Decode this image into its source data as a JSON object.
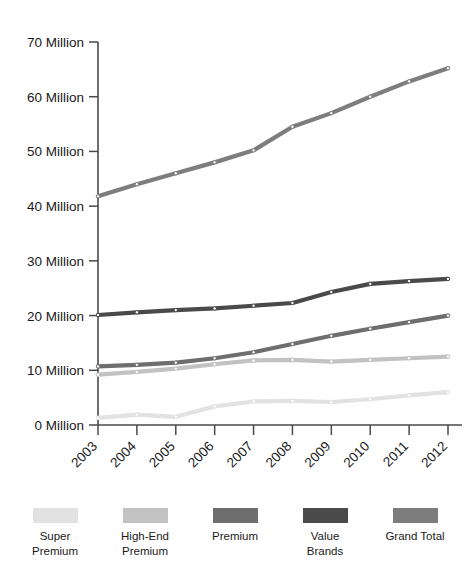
{
  "chart_data": {
    "type": "line",
    "title": "",
    "subtitle": "",
    "xlabel": "",
    "ylabel": "",
    "categories": [
      "2003",
      "2004",
      "2005",
      "2006",
      "2007",
      "2008",
      "2009",
      "2010",
      "2011",
      "2012"
    ],
    "x": [
      2003,
      2004,
      2005,
      2006,
      2007,
      2008,
      2009,
      2010,
      2011,
      2012
    ],
    "ylim": [
      0,
      70
    ],
    "ytick_values": [
      0,
      10,
      20,
      30,
      40,
      50,
      60,
      70
    ],
    "ytick_labels": [
      "0 Million",
      "10 Million",
      "20 Million",
      "30 Million",
      "40 Million",
      "50 Million",
      "60 Million",
      "70 Million"
    ],
    "xtick_labels": [
      "2003",
      "2004",
      "2005",
      "2006",
      "2007",
      "2008",
      "2009",
      "2010",
      "2011",
      "2012"
    ],
    "xtick_rotation": 45,
    "grid": false,
    "legend_position": "bottom",
    "units": "Million",
    "markers": true,
    "series": [
      {
        "name": "Super Premium",
        "legend_label": "Super\nPremium",
        "color": "#e2e2e2",
        "values": [
          1.3,
          1.9,
          1.5,
          3.4,
          4.3,
          4.4,
          4.2,
          4.7,
          5.4,
          6.0
        ]
      },
      {
        "name": "High-End Premium",
        "legend_label": "High-End\nPremium",
        "color": "#c2c2c2",
        "values": [
          9.2,
          9.7,
          10.3,
          11.1,
          11.8,
          11.9,
          11.6,
          11.9,
          12.2,
          12.5
        ]
      },
      {
        "name": "Premium",
        "legend_label": "Premium",
        "color": "#6e6e6e",
        "values": [
          10.7,
          11.0,
          11.4,
          12.2,
          13.3,
          14.8,
          16.3,
          17.6,
          18.8,
          20.0
        ]
      },
      {
        "name": "Value Brands",
        "legend_label": "Value Brands",
        "color": "#4a4a4a",
        "values": [
          20.1,
          20.6,
          21.0,
          21.3,
          21.8,
          22.3,
          24.3,
          25.8,
          26.3,
          26.7
        ]
      },
      {
        "name": "Grand Total",
        "legend_label": "Grand Total",
        "color": "#7d7d7d",
        "values": [
          41.8,
          44.0,
          46.0,
          48.0,
          50.2,
          54.5,
          57.0,
          60.0,
          62.8,
          65.2
        ]
      }
    ]
  },
  "legend": {
    "items": [
      {
        "label": "Super\nPremium",
        "color": "#e2e2e2"
      },
      {
        "label": "High-End\nPremium",
        "color": "#c2c2c2"
      },
      {
        "label": "Premium",
        "color": "#6e6e6e"
      },
      {
        "label": "Value Brands",
        "color": "#4a4a4a"
      },
      {
        "label": "Grand Total",
        "color": "#7d7d7d"
      }
    ]
  }
}
